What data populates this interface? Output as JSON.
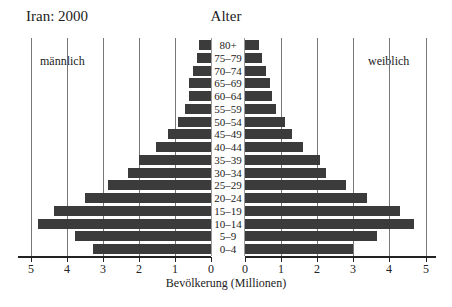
{
  "chart_data": {
    "type": "bar",
    "subtype": "population-pyramid",
    "title": "Iran: 2000",
    "center_title": "Alter",
    "xlabel": "Bevölkerung (Millionen)",
    "ylabel": "Alter",
    "xlim": [
      0,
      5
    ],
    "grid": true,
    "tick_labels_left": [
      "5",
      "4",
      "3",
      "2",
      "1",
      "0"
    ],
    "tick_labels_right": [
      "0",
      "1",
      "2",
      "3",
      "4",
      "5"
    ],
    "categories": [
      "80+",
      "75–79",
      "70–74",
      "65–69",
      "60–64",
      "55–59",
      "50–54",
      "45–49",
      "40–44",
      "35–39",
      "30–34",
      "25–29",
      "20–24",
      "15–19",
      "10–14",
      "5–9",
      "0–4"
    ],
    "series": [
      {
        "name": "männlich",
        "side": "left",
        "values": [
          0.33,
          0.39,
          0.5,
          0.61,
          0.61,
          0.72,
          0.92,
          1.19,
          1.53,
          2.0,
          2.3,
          2.86,
          3.5,
          4.36,
          4.8,
          3.78,
          3.28
        ]
      },
      {
        "name": "weiblich",
        "side": "right",
        "values": [
          0.39,
          0.47,
          0.58,
          0.69,
          0.75,
          0.86,
          1.11,
          1.31,
          1.61,
          2.08,
          2.25,
          2.81,
          3.39,
          4.28,
          4.67,
          3.67,
          3.0
        ]
      }
    ],
    "bar_color": "#3b3b3b"
  }
}
